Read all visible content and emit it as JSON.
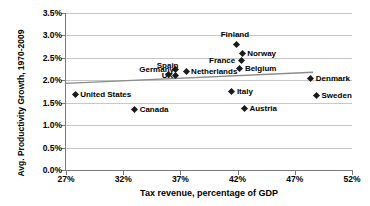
{
  "chart_data": {
    "type": "scatter",
    "title": "",
    "xlabel": "Tax revenue, percentage of GDP",
    "ylabel": "Avg. Productivity Growth, 1970-2009",
    "xlim": [
      27,
      52
    ],
    "ylim": [
      0.0,
      3.5
    ],
    "xticks": [
      "27%",
      "32%",
      "37%",
      "42%",
      "47%",
      "52%"
    ],
    "xtick_values": [
      27,
      32,
      37,
      42,
      47,
      52
    ],
    "yticks": [
      "0.0%",
      "0.5%",
      "1.0%",
      "1.5%",
      "2.0%",
      "2.5%",
      "3.0%",
      "3.5%"
    ],
    "ytick_values": [
      0.0,
      0.5,
      1.0,
      1.5,
      2.0,
      2.5,
      3.0,
      3.5
    ],
    "grid": true,
    "legend": "none",
    "marker_color": "#1a1a1a",
    "marker_shape": "diamond",
    "gridline_color": "#c8c8c8",
    "axis_color": "#7a7a7a",
    "points": [
      {
        "label": "United States",
        "x": 27.8,
        "y": 1.69,
        "label_pos": "right"
      },
      {
        "label": "Canada",
        "x": 33.0,
        "y": 1.34,
        "label_pos": "right"
      },
      {
        "label": "Germany",
        "x": 36.6,
        "y": 2.25,
        "label_pos": "left"
      },
      {
        "label": "UK",
        "x": 36.6,
        "y": 2.1,
        "label_pos": "left"
      },
      {
        "label": "Spain",
        "x": 36.0,
        "y": 2.13,
        "label_pos": "above-left"
      },
      {
        "label": "Netherlands",
        "x": 37.5,
        "y": 2.2,
        "label_pos": "right"
      },
      {
        "label": "Finland",
        "x": 41.9,
        "y": 2.8,
        "label_pos": "above"
      },
      {
        "label": "France",
        "x": 42.3,
        "y": 2.45,
        "label_pos": "left"
      },
      {
        "label": "Norway",
        "x": 42.4,
        "y": 2.6,
        "label_pos": "right"
      },
      {
        "label": "Belgium",
        "x": 42.2,
        "y": 2.27,
        "label_pos": "right"
      },
      {
        "label": "Italy",
        "x": 41.5,
        "y": 1.76,
        "label_pos": "right"
      },
      {
        "label": "Austria",
        "x": 42.6,
        "y": 1.38,
        "label_pos": "right"
      },
      {
        "label": "Denmark",
        "x": 48.4,
        "y": 2.03,
        "label_pos": "right"
      },
      {
        "label": "Sweden",
        "x": 48.9,
        "y": 1.67,
        "label_pos": "right"
      }
    ],
    "trendline": {
      "visible": true,
      "x_start": 27.0,
      "y_start": 1.93,
      "x_end": 48.6,
      "y_end": 2.18,
      "color": "#8c8c8c"
    }
  }
}
